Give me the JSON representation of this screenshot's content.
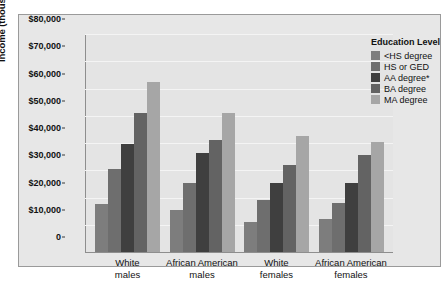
{
  "chart_data": {
    "type": "bar",
    "title": "",
    "subtitle": "",
    "xlabel": "",
    "ylabel": "Income (thousands)",
    "ylim": [
      0,
      80000
    ],
    "ytick_values": [
      0,
      10000,
      20000,
      30000,
      40000,
      50000,
      60000,
      70000,
      80000
    ],
    "ytick_labels": [
      "0",
      "$10,000",
      "$20,000",
      "$30,000",
      "$40,000",
      "$50,000",
      "$60,000",
      "$70,000",
      "$80,000"
    ],
    "grid": true,
    "legend_position": "top-right",
    "legend_title": "Education Level",
    "categories": [
      "White males",
      "African American males",
      "White females",
      "African American females"
    ],
    "category_lines": [
      [
        "White",
        "males"
      ],
      [
        "African American",
        "males"
      ],
      [
        "White",
        "females"
      ],
      [
        "African American",
        "females"
      ]
    ],
    "series": [
      {
        "name": "<HS degree",
        "color": "#7d7d7d",
        "values": [
          17500,
          15500,
          11000,
          12000
        ]
      },
      {
        "name": "HS or GED",
        "color": "#6e6e6e",
        "values": [
          30500,
          25500,
          19000,
          18000
        ]
      },
      {
        "name": "AA degree*",
        "color": "#3f3f3f",
        "values": [
          39500,
          36500,
          25500,
          25500
        ]
      },
      {
        "name": "BA degree",
        "color": "#636363",
        "values": [
          51000,
          41000,
          32000,
          35500
        ]
      },
      {
        "name": "MA degree",
        "color": "#a6a6a6",
        "values": [
          62500,
          51000,
          42500,
          40500
        ]
      }
    ]
  },
  "legend": {
    "title": "Education Level",
    "items": [
      {
        "label": "<HS degree",
        "color": "#7d7d7d"
      },
      {
        "label": "HS or GED",
        "color": "#6e6e6e"
      },
      {
        "label": "AA degree*",
        "color": "#3f3f3f"
      },
      {
        "label": "BA degree",
        "color": "#636363"
      },
      {
        "label": "MA degree",
        "color": "#a6a6a6"
      }
    ]
  },
  "axes": {
    "y_title": "Income (thousands)"
  }
}
